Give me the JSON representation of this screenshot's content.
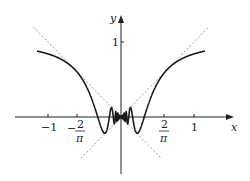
{
  "chart_data": {
    "type": "line",
    "title": "",
    "function": "y = x sin(1/x)",
    "xlabel": "x",
    "ylabel": "y",
    "xlim": [
      -1.5,
      1.5
    ],
    "ylim": [
      -0.75,
      1.35
    ],
    "x_ticks": [
      {
        "value": -1,
        "label": "−1"
      },
      {
        "value": -0.6366,
        "label": "−2/π"
      },
      {
        "value": 0.6366,
        "label": "2/π"
      },
      {
        "value": 1,
        "label": "1"
      }
    ],
    "y_ticks": [
      {
        "value": 1,
        "label": "1"
      }
    ],
    "series": [
      {
        "name": "x sin(1/x)",
        "style": "solid",
        "color": "#222222",
        "domain": [
          -1.15,
          1.15
        ]
      },
      {
        "name": "y = x",
        "style": "dashed",
        "color": "#999999",
        "domain": [
          -0.55,
          1.2
        ]
      },
      {
        "name": "y = -x",
        "style": "dashed",
        "color": "#999999",
        "domain": [
          -1.2,
          0.55
        ]
      }
    ],
    "grid": false,
    "legend": null
  },
  "labels": {
    "x_axis": "x",
    "y_axis": "y",
    "tick_neg1": "−1",
    "tick_pos1": "1",
    "tick_y1": "1",
    "two": "2",
    "pi": "π",
    "minus": "−"
  }
}
